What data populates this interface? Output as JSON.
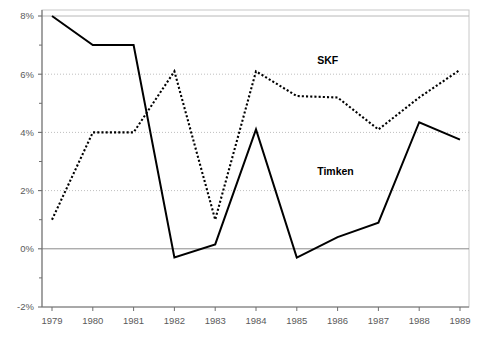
{
  "chart_data": {
    "type": "line",
    "title": "",
    "subtitle": "",
    "xlabel": "",
    "ylabel": "",
    "categories": [
      "1979",
      "1980",
      "1981",
      "1982",
      "1983",
      "1984",
      "1985",
      "1986",
      "1987",
      "1988",
      "1989"
    ],
    "x": [
      1979,
      1980,
      1981,
      1982,
      1983,
      1984,
      1985,
      1986,
      1987,
      1988,
      1989
    ],
    "xlim": [
      1979,
      1989
    ],
    "ylim": [
      -2,
      8
    ],
    "ytick_labels": [
      "8%",
      "6%",
      "4%",
      "2%",
      "0%",
      "-2%"
    ],
    "ytick_values": [
      8,
      6,
      4,
      2,
      0,
      -2
    ],
    "yminor_values": [
      7,
      5,
      3,
      1,
      -1
    ],
    "grid": "horizontal-major-dotted",
    "legend_position": "inline-annotations",
    "series": [
      {
        "name": "SKF",
        "style": "dotted",
        "color": "#000000",
        "label_x": 1985.5,
        "label_y": 6.35,
        "values": [
          1.0,
          4.0,
          4.0,
          6.1,
          1.0,
          6.1,
          5.25,
          5.2,
          4.1,
          5.2,
          6.15
        ]
      },
      {
        "name": "Timken",
        "style": "solid",
        "color": "#000000",
        "label_x": 1985.5,
        "label_y": 2.55,
        "values": [
          8.0,
          7.0,
          7.0,
          -0.3,
          0.15,
          4.1,
          -0.3,
          0.4,
          0.9,
          4.35,
          3.75
        ]
      }
    ],
    "colors": {
      "axis": "#6e6e6e",
      "grid": "#bfbfbf",
      "zero_line": "#8a8a8a",
      "frame": "#c8c8c8",
      "tick_text": "#5a5a5a",
      "series_label": "#000000",
      "background": "#ffffff"
    }
  }
}
